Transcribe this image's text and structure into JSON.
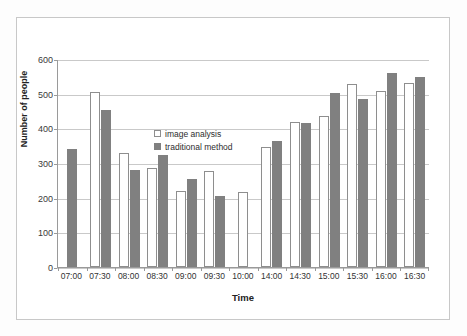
{
  "figure": {
    "top_artifact": "",
    "frame_border_color": "#c8c8c8",
    "background": "#ffffff"
  },
  "chart_data": {
    "type": "bar",
    "title": "",
    "xlabel": "Time",
    "ylabel": "Number of people",
    "ylim": [
      0,
      600
    ],
    "ytick_step": 100,
    "yticks": [
      "0",
      "100",
      "200",
      "300",
      "400",
      "500",
      "600"
    ],
    "grid": true,
    "legend_position": "top-left inside plot",
    "categories": [
      "07:00",
      "07:30",
      "08:00",
      "08:30",
      "09:00",
      "09:30",
      "10:00",
      "14:00",
      "14:30",
      "15:00",
      "15:30",
      "16:00",
      "16:30"
    ],
    "series": [
      {
        "name": "image analysis",
        "color": "#ffffff",
        "edge_color": "#8e8e8e",
        "values": [
          0,
          505,
          328,
          286,
          218,
          277,
          217,
          347,
          418,
          436,
          527,
          509,
          532
        ]
      },
      {
        "name": "traditional method",
        "color": "#808080",
        "edge_color": "#808080",
        "values": [
          340,
          453,
          281,
          322,
          255,
          205,
          0,
          364,
          414,
          501,
          486,
          560,
          549
        ]
      }
    ]
  }
}
